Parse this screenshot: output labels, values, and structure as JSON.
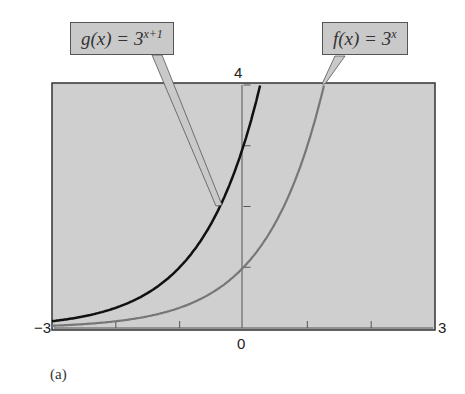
{
  "chart_data": {
    "type": "line",
    "title": "",
    "xlabel": "",
    "ylabel": "",
    "xlim": [
      -3,
      3
    ],
    "ylim": [
      0,
      4
    ],
    "x_tick_labels": {
      "min": "-3",
      "zero": "0",
      "max": "3"
    },
    "y_tick_labels": {
      "max": "4"
    },
    "x_ticks": [
      -2,
      -1,
      1,
      2
    ],
    "y_ticks": [
      1,
      2,
      3
    ],
    "grid": false,
    "series": [
      {
        "name": "g(x) = 3^(x+1)",
        "expr": "3^(x+1)",
        "color": "#111111",
        "x": [
          -3,
          -2,
          -1,
          0,
          0.26
        ],
        "y": [
          0.111,
          0.333,
          1,
          3,
          4
        ]
      },
      {
        "name": "f(x) = 3^x",
        "expr": "3^x",
        "color": "#777777",
        "x": [
          -3,
          -2,
          -1,
          0,
          1,
          1.26
        ],
        "y": [
          0.037,
          0.111,
          0.333,
          1,
          3,
          4
        ]
      }
    ],
    "annotations": [
      {
        "text": "g(x) = 3^(x+1)",
        "points_to": "g curve"
      },
      {
        "text": "f(x) = 3^x",
        "points_to": "f curve at top"
      }
    ]
  },
  "labels": {
    "g_prefix": "g(x) = 3",
    "g_exp": "x+1",
    "f_prefix": "f(x) = 3",
    "f_exp": "x",
    "x_min": "−3",
    "x_max": "3",
    "x_zero": "0",
    "y_max": "4",
    "caption": "(a)"
  },
  "colors": {
    "plot_bg": "#cfcfcf",
    "g": "#111111",
    "f": "#777777",
    "callout_bg": "#c9c9c9"
  }
}
